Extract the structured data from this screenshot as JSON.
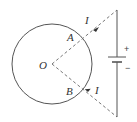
{
  "diagram": {
    "type": "physics-circuit",
    "labels": {
      "center": "O",
      "point_a": "A",
      "point_b": "B",
      "current_top": "I",
      "current_bottom": "I",
      "battery_positive": "+",
      "battery_negative": "−"
    },
    "colors": {
      "stroke": "#555555",
      "dashed": "#777777",
      "text": "#333333"
    }
  }
}
